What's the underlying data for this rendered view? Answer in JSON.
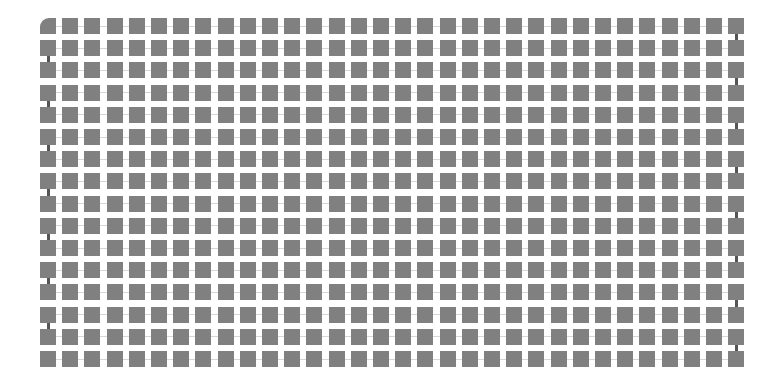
{
  "canvas": {
    "width": 773,
    "height": 389,
    "background": "#ffffff"
  },
  "chart_data": {
    "type": "heatmap",
    "title": "",
    "subtitle": "",
    "xlabel": "",
    "ylabel": "",
    "legend": [],
    "annotations": [],
    "grid": false,
    "rows": 16,
    "columns": 32,
    "values_uniform": true,
    "cell_value": 1,
    "categories": [],
    "values": [],
    "xlim": [
      0,
      32
    ],
    "ylim": [
      0,
      16
    ]
  },
  "layout": {
    "origin_x": 40,
    "origin_y": 18,
    "cell_size": 16,
    "pitch_x": 22.2,
    "pitch_y": 22.2,
    "columns": 32,
    "rows": 16
  },
  "style": {
    "cell_color": "#808080",
    "h_link_color": "#d6d6d6",
    "v_link_color": "#555555",
    "h_link_thickness": 1,
    "v_link_thickness": 3,
    "corner_radius": 9
  },
  "connectors": {
    "horizontal_between_all_adjacent_columns": true,
    "vertical_columns": [
      0,
      31
    ],
    "vertical_left_column_start_gap": 1,
    "vertical_right_column_start_gap": 0,
    "vertical_gap_stride": 2
  },
  "accent": {
    "rounded_corner_cell_row": 0,
    "rounded_corner_cell_column": 0
  }
}
